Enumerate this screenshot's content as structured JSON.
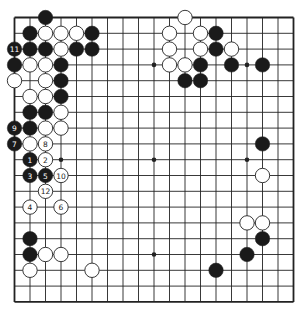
{
  "board": {
    "size": 19,
    "origin": {
      "x": 14.5,
      "y": 17.5
    },
    "spacing": {
      "x": 15.5,
      "y": 15.8
    },
    "stone_radius": 7.2,
    "colors": {
      "line": "#222222",
      "black": "#1a1a1a",
      "white": "#ffffff",
      "stone_outline": "#222222",
      "background": "#ffffff"
    },
    "star_points": [
      [
        3,
        3
      ],
      [
        9,
        3
      ],
      [
        15,
        3
      ],
      [
        3,
        9
      ],
      [
        9,
        9
      ],
      [
        15,
        9
      ],
      [
        3,
        15
      ],
      [
        9,
        15
      ],
      [
        15,
        15
      ]
    ],
    "stones": [
      {
        "col": 2,
        "row": 0,
        "color": "black"
      },
      {
        "col": 11,
        "row": 0,
        "color": "white"
      },
      {
        "col": 1,
        "row": 1,
        "color": "black"
      },
      {
        "col": 2,
        "row": 1,
        "color": "white"
      },
      {
        "col": 3,
        "row": 1,
        "color": "white"
      },
      {
        "col": 4,
        "row": 1,
        "color": "white"
      },
      {
        "col": 5,
        "row": 1,
        "color": "black"
      },
      {
        "col": 10,
        "row": 1,
        "color": "white"
      },
      {
        "col": 12,
        "row": 1,
        "color": "white"
      },
      {
        "col": 13,
        "row": 1,
        "color": "black"
      },
      {
        "col": 0,
        "row": 2,
        "color": "black",
        "label": "11"
      },
      {
        "col": 1,
        "row": 2,
        "color": "black"
      },
      {
        "col": 2,
        "row": 2,
        "color": "black"
      },
      {
        "col": 3,
        "row": 2,
        "color": "white"
      },
      {
        "col": 4,
        "row": 2,
        "color": "black"
      },
      {
        "col": 5,
        "row": 2,
        "color": "black"
      },
      {
        "col": 10,
        "row": 2,
        "color": "white"
      },
      {
        "col": 12,
        "row": 2,
        "color": "white"
      },
      {
        "col": 13,
        "row": 2,
        "color": "black"
      },
      {
        "col": 14,
        "row": 2,
        "color": "white"
      },
      {
        "col": 0,
        "row": 3,
        "color": "black"
      },
      {
        "col": 1,
        "row": 3,
        "color": "white"
      },
      {
        "col": 2,
        "row": 3,
        "color": "white"
      },
      {
        "col": 3,
        "row": 3,
        "color": "black"
      },
      {
        "col": 10,
        "row": 3,
        "color": "white"
      },
      {
        "col": 11,
        "row": 3,
        "color": "white"
      },
      {
        "col": 12,
        "row": 3,
        "color": "black"
      },
      {
        "col": 14,
        "row": 3,
        "color": "black"
      },
      {
        "col": 16,
        "row": 3,
        "color": "black"
      },
      {
        "col": 0,
        "row": 4,
        "color": "white"
      },
      {
        "col": 2,
        "row": 4,
        "color": "white"
      },
      {
        "col": 3,
        "row": 4,
        "color": "black"
      },
      {
        "col": 11,
        "row": 4,
        "color": "black"
      },
      {
        "col": 12,
        "row": 4,
        "color": "black"
      },
      {
        "col": 1,
        "row": 5,
        "color": "white"
      },
      {
        "col": 2,
        "row": 5,
        "color": "white"
      },
      {
        "col": 3,
        "row": 5,
        "color": "black"
      },
      {
        "col": 1,
        "row": 6,
        "color": "black"
      },
      {
        "col": 2,
        "row": 6,
        "color": "black"
      },
      {
        "col": 3,
        "row": 6,
        "color": "white"
      },
      {
        "col": 0,
        "row": 7,
        "color": "black",
        "label": "9"
      },
      {
        "col": 1,
        "row": 7,
        "color": "black"
      },
      {
        "col": 2,
        "row": 7,
        "color": "white"
      },
      {
        "col": 3,
        "row": 7,
        "color": "white"
      },
      {
        "col": 0,
        "row": 8,
        "color": "black",
        "label": "7"
      },
      {
        "col": 1,
        "row": 8,
        "color": "white"
      },
      {
        "col": 2,
        "row": 8,
        "color": "white",
        "label": "8"
      },
      {
        "col": 16,
        "row": 8,
        "color": "black"
      },
      {
        "col": 1,
        "row": 9,
        "color": "black",
        "label": "1"
      },
      {
        "col": 2,
        "row": 9,
        "color": "white",
        "label": "2"
      },
      {
        "col": 1,
        "row": 10,
        "color": "black",
        "label": "3"
      },
      {
        "col": 2,
        "row": 10,
        "color": "black",
        "label": "5"
      },
      {
        "col": 3,
        "row": 10,
        "color": "white",
        "label": "10"
      },
      {
        "col": 16,
        "row": 10,
        "color": "white"
      },
      {
        "col": 2,
        "row": 11,
        "color": "white",
        "label": "12"
      },
      {
        "col": 1,
        "row": 12,
        "color": "white",
        "label": "4"
      },
      {
        "col": 3,
        "row": 12,
        "color": "white",
        "label": "6"
      },
      {
        "col": 15,
        "row": 13,
        "color": "white"
      },
      {
        "col": 16,
        "row": 13,
        "color": "white"
      },
      {
        "col": 1,
        "row": 14,
        "color": "black"
      },
      {
        "col": 16,
        "row": 14,
        "color": "black"
      },
      {
        "col": 1,
        "row": 15,
        "color": "black"
      },
      {
        "col": 2,
        "row": 15,
        "color": "white"
      },
      {
        "col": 3,
        "row": 15,
        "color": "white"
      },
      {
        "col": 15,
        "row": 15,
        "color": "black"
      },
      {
        "col": 1,
        "row": 16,
        "color": "white"
      },
      {
        "col": 5,
        "row": 16,
        "color": "white"
      },
      {
        "col": 13,
        "row": 16,
        "color": "black"
      }
    ]
  }
}
